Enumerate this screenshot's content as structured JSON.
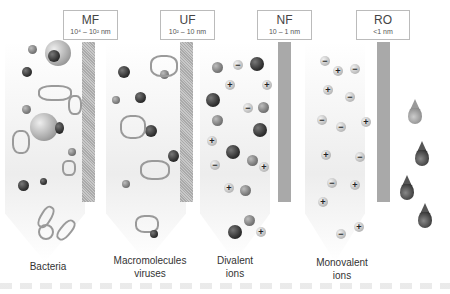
{
  "diagram": {
    "stages": [
      {
        "id": "mf",
        "label": "MF",
        "range": "10⁴ – 10² nm",
        "rejects": "Bacteria",
        "membrane_style": "dotted"
      },
      {
        "id": "uf",
        "label": "UF",
        "range": "10² – 10 nm",
        "rejects": "Macromolecules viruses",
        "membrane_style": "dotted"
      },
      {
        "id": "nf",
        "label": "NF",
        "range": "10 – 1 nm",
        "rejects": "Divalent ions",
        "membrane_style": "solid"
      },
      {
        "id": "ro",
        "label": "RO",
        "range": "<1 nm",
        "rejects": "Monovalent ions",
        "membrane_style": "solid"
      }
    ],
    "captions": {
      "bacteria": "Bacteria",
      "macro_line1": "Macromolecules",
      "macro_line2": "viruses",
      "divalent_line1": "Divalent",
      "divalent_line2": "ions",
      "monovalent_line1": "Monovalent",
      "monovalent_line2": "ions"
    },
    "symbols": {
      "plus": "+",
      "minus": "−"
    },
    "output": "water droplets"
  }
}
